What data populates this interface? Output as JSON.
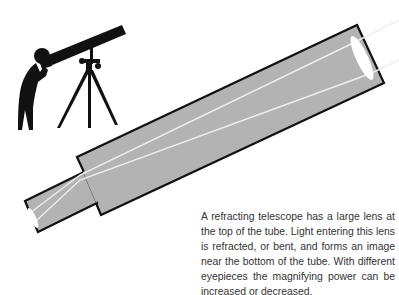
{
  "figure": {
    "colors": {
      "tube_fill": "#b3b3b3",
      "tube_outline": "#111111",
      "light_ray": "#eeeeee",
      "lens": "#ffffff",
      "silhouette": "#111111"
    }
  },
  "caption": {
    "text": "A refracting telescope has a large lens at the top of the tube. Light entering this lens is refracted, or bent, and forms an image near the bottom of the tube. With different eyepieces the magnifying power can be increased or decreased."
  }
}
